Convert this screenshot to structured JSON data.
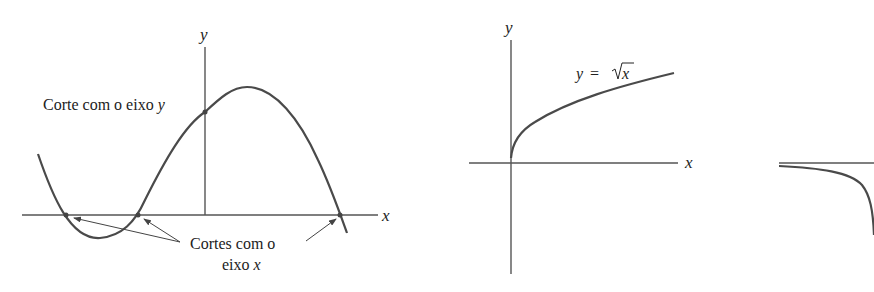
{
  "figure1": {
    "y_axis_label": "y",
    "x_axis_label": "x",
    "y_intercept_label": "Corte com o eixo ",
    "y_intercept_var": "y",
    "x_intercepts_label_line1": "Cortes com o",
    "x_intercepts_label_line2": "eixo ",
    "x_intercepts_var": "x"
  },
  "figure2": {
    "y_axis_label": "y",
    "x_axis_label": "x",
    "curve_label_lhs": "y",
    "curve_label_eq": "=",
    "curve_label_rhs": "x"
  },
  "colors": {
    "stroke": "#555555",
    "curve": "#4a4a4a",
    "text": "#222222"
  }
}
